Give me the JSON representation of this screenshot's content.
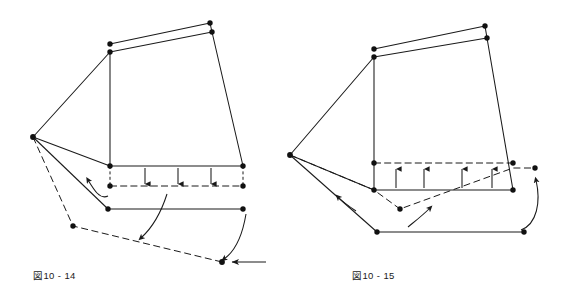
{
  "page": {
    "width": 564,
    "height": 297,
    "background_color": "#ffffff",
    "stroke_color": "#1a1a1a",
    "vertex_color": "#111111"
  },
  "figures": [
    {
      "id": "figure-10-14",
      "caption": "図10 - 14",
      "description": "Folded sheet / plate diagram with three downward arrows indicating downward deflection",
      "arrow_direction": "down",
      "arrow_count": 3,
      "body_outline": [
        [
          110,
          52
        ],
        [
          33,
          137
        ],
        [
          110,
          166
        ],
        [
          243,
          166
        ],
        [
          212,
          32
        ]
      ],
      "top_edge_double": [
        {
          "from": [
            110,
            44
          ],
          "to": [
            210,
            23
          ]
        },
        {
          "from": [
            110,
            52
          ],
          "to": [
            212,
            32
          ]
        }
      ],
      "load_bar_solid": {
        "from": [
          110,
          166
        ],
        "to": [
          243,
          166
        ]
      },
      "load_bar_dashed": {
        "from": [
          110,
          186
        ],
        "to": [
          243,
          186
        ]
      },
      "arrow_x_positions": [
        145,
        178,
        211
      ],
      "arrow_y_from": 168,
      "arrow_y_to": 185,
      "lower_solid_line": {
        "from": [
          108,
          209
        ],
        "to": [
          243,
          209
        ]
      },
      "dashed_polyline": [
        [
          33,
          137
        ],
        [
          73,
          226
        ],
        [
          222,
          262
        ]
      ],
      "tangent_solid_line": {
        "from": [
          33,
          137
        ],
        "to": [
          108,
          209
        ]
      },
      "curved_arrows": [
        {
          "name": "curve-to-dashed-upper",
          "path": "M 108,196 C 100,200 94,190 88,180"
        },
        {
          "name": "curve-to-dashed-mid",
          "path": "M 167,194 C 160,216 152,228 141,238"
        },
        {
          "name": "curve-to-dashed-lower",
          "path": "M 246,214 C 242,238 234,252 224,259"
        }
      ],
      "straight_arrow": {
        "from": [
          266,
          262
        ],
        "to": [
          231,
          262
        ],
        "name": "horizontal-pointer"
      },
      "vertices": [
        [
          110,
          44
        ],
        [
          110,
          52
        ],
        [
          210,
          23
        ],
        [
          212,
          32
        ],
        [
          33,
          137
        ],
        [
          110,
          166
        ],
        [
          243,
          166
        ],
        [
          110,
          186
        ],
        [
          243,
          186
        ],
        [
          108,
          209
        ],
        [
          243,
          209
        ],
        [
          73,
          226
        ],
        [
          222,
          262
        ]
      ]
    },
    {
      "id": "figure-10-15",
      "caption": "図10 - 15",
      "description": "Folded sheet / plate diagram with four upward arrows indicating upward deflection",
      "arrow_direction": "up",
      "arrow_count": 4,
      "body_outline": [
        [
          374,
          57
        ],
        [
          290,
          155
        ],
        [
          374,
          190
        ],
        [
          513,
          190
        ],
        [
          487,
          38
        ]
      ],
      "top_edge_double": [
        {
          "from": [
            374,
            49
          ],
          "to": [
            485,
            26
          ]
        },
        {
          "from": [
            374,
            57
          ],
          "to": [
            487,
            38
          ]
        }
      ],
      "load_bar_dashed": {
        "from": [
          374,
          163
        ],
        "to": [
          513,
          163
        ]
      },
      "load_bar_solid": {
        "from": [
          374,
          190
        ],
        "to": [
          513,
          190
        ]
      },
      "arrow_x_positions": [
        396,
        424,
        462,
        492
      ],
      "arrow_y_from": 188,
      "arrow_y_to": 168,
      "lower_solid_line": {
        "from": [
          377,
          232
        ],
        "to": [
          524,
          232
        ]
      },
      "dashed_polyline": [
        [
          290,
          155
        ],
        [
          374,
          190
        ],
        [
          400,
          209
        ],
        [
          513,
          168
        ]
      ],
      "dashed_apex_line": {
        "from": [
          290,
          155
        ],
        "to": [
          374,
          190
        ]
      },
      "tangent_solid_line": {
        "from": [
          290,
          155
        ],
        "to": [
          377,
          232
        ]
      },
      "free_vertex": [
        535,
        168
      ],
      "curved_arrows": [
        {
          "name": "curve-to-apex-line",
          "path": "M 356,211 C 350,207 344,203 338,197"
        },
        {
          "name": "curve-to-dashed-mid",
          "path": "M 408,227 C 414,222 422,216 430,208"
        },
        {
          "name": "curve-to-free-vertex",
          "path": "M 521,230 C 537,224 541,202 536,180"
        }
      ],
      "vertices": [
        [
          374,
          49
        ],
        [
          374,
          57
        ],
        [
          485,
          26
        ],
        [
          487,
          38
        ],
        [
          290,
          155
        ],
        [
          374,
          163
        ],
        [
          513,
          163
        ],
        [
          374,
          190
        ],
        [
          513,
          190
        ],
        [
          377,
          232
        ],
        [
          524,
          232
        ],
        [
          400,
          209
        ],
        [
          535,
          168
        ]
      ]
    }
  ]
}
